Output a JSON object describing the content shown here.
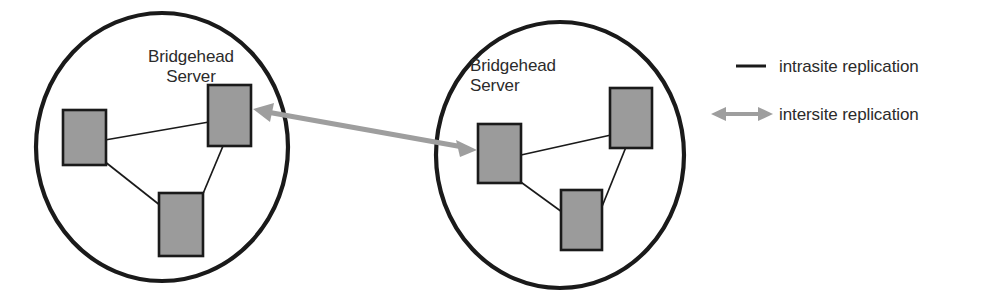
{
  "diagram": {
    "type": "network-topology",
    "canvas": {
      "width": 983,
      "height": 292
    },
    "colors": {
      "background": "#ffffff",
      "site_boundary": "#1a1a1a",
      "server_fill": "#9b9b9b",
      "server_stroke": "#1a1a1a",
      "intrasite_line": "#1a1a1a",
      "intersite_arrow": "#9e9e9e",
      "text": "#2b2b2b"
    },
    "sites": [
      {
        "id": "site-left",
        "label": "Bridgehead\nServer",
        "label_lines": [
          "Bridgehead",
          "Server"
        ],
        "boundary": {
          "shape": "ellipse",
          "cx": 162,
          "cy": 147,
          "rx": 126,
          "ry": 134
        },
        "servers": [
          {
            "id": "left-server-west",
            "name": "domain-controller",
            "role": "member",
            "x": 63,
            "y": 110,
            "w": 43,
            "h": 55
          },
          {
            "id": "left-server-bridgehead",
            "name": "bridgehead-server",
            "role": "bridgehead",
            "x": 208,
            "y": 85,
            "w": 43,
            "h": 61
          },
          {
            "id": "left-server-south",
            "name": "domain-controller",
            "role": "member",
            "x": 159,
            "y": 193,
            "w": 44,
            "h": 63
          }
        ],
        "intrasite_links": [
          {
            "from": "left-server-west",
            "to": "left-server-bridgehead"
          },
          {
            "from": "left-server-west",
            "to": "left-server-south"
          },
          {
            "from": "left-server-south",
            "to": "left-server-bridgehead"
          }
        ]
      },
      {
        "id": "site-right",
        "label": "Bridgehead\nServer",
        "label_lines": [
          "Bridgehead",
          "Server"
        ],
        "boundary": {
          "shape": "ellipse",
          "cx": 560,
          "cy": 155,
          "rx": 124,
          "ry": 133
        },
        "servers": [
          {
            "id": "right-server-bridgehead",
            "name": "bridgehead-server",
            "role": "bridgehead",
            "x": 478,
            "y": 124,
            "w": 43,
            "h": 59
          },
          {
            "id": "right-server-northeast",
            "name": "domain-controller",
            "role": "member",
            "x": 610,
            "y": 88,
            "w": 42,
            "h": 60
          },
          {
            "id": "right-server-south",
            "name": "domain-controller",
            "role": "member",
            "x": 561,
            "y": 190,
            "w": 41,
            "h": 60
          }
        ],
        "intrasite_links": [
          {
            "from": "right-server-bridgehead",
            "to": "right-server-northeast"
          },
          {
            "from": "right-server-bridgehead",
            "to": "right-server-south"
          },
          {
            "from": "right-server-south",
            "to": "right-server-northeast"
          }
        ]
      }
    ],
    "intersite_links": [
      {
        "id": "intersite-arrow",
        "from": "left-server-bridgehead",
        "to": "right-server-bridgehead",
        "bidirectional": true,
        "x1": 254,
        "y1": 110,
        "x2": 474,
        "y2": 149
      }
    ]
  },
  "legend": {
    "items": [
      {
        "id": "legend-intrasite",
        "marker": "line",
        "label": "intrasite replication",
        "color": "#1a1a1a"
      },
      {
        "id": "legend-intersite",
        "marker": "double-arrow",
        "label": "intersite replication",
        "color": "#9e9e9e"
      }
    ]
  }
}
